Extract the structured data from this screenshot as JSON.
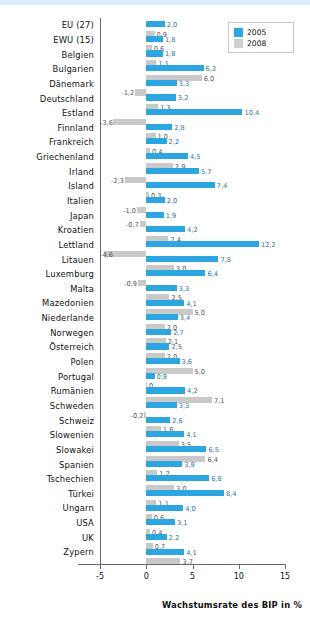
{
  "chart_data": {
    "type": "bar",
    "title": "",
    "xlabel": "Wachstumsrate des BIP in %",
    "ylabel": "",
    "xlim": [
      -5,
      15
    ],
    "xticks": [
      "-5",
      "0",
      "5",
      "10",
      "15"
    ],
    "grid": false,
    "legend_position": "top-right",
    "orientation": "horizontal",
    "categories": [
      "EU (27)",
      "EWU (15)",
      "Belgien",
      "Bulgarien",
      "Dänemark",
      "Deutschland",
      "Estland",
      "Finnland",
      "Frankreich",
      "Griechenland",
      "Irland",
      "Island",
      "Italien",
      "Japan",
      "Kroatien",
      "Lettland",
      "Litauen",
      "Luxemburg",
      "Malta",
      "Mazedonien",
      "Niederlande",
      "Norwegen",
      "Österreich",
      "Polen",
      "Portugal",
      "Rumänien",
      "Schweden",
      "Schweiz",
      "Slowenien",
      "Slowakei",
      "Spanien",
      "Tschechien",
      "Türkei",
      "Ungarn",
      "USA",
      "UK",
      "Zypern"
    ],
    "series": [
      {
        "name": "2005",
        "color": "#2ca6e0",
        "values": [
          2.0,
          1.8,
          1.8,
          6.2,
          3.3,
          3.2,
          10.4,
          2.8,
          2.2,
          4.5,
          5.7,
          7.4,
          2.0,
          1.9,
          4.2,
          12.2,
          7.8,
          6.4,
          3.3,
          4.1,
          3.4,
          2.7,
          2.5,
          3.6,
          0.9,
          4.2,
          3.3,
          2.6,
          4.1,
          6.5,
          3.9,
          6.8,
          8.4,
          4.0,
          3.1,
          2.2,
          4.1
        ],
        "labels": [
          "2,0",
          "1,8",
          "1,8",
          "6,2",
          "3,3",
          "3,2",
          "10,4",
          "2,8",
          "2,2",
          "4,5",
          "5,7",
          "7,4",
          "2,0",
          "1,9",
          "4,2",
          "12,2",
          "7,8",
          "6,4",
          "3,3",
          "4,1",
          "3,4",
          "2,7",
          "2,5",
          "3,6",
          "0,9",
          "4,2",
          "3,3",
          "2,6",
          "4,1",
          "6,5",
          "3,9",
          "6,8",
          "8,4",
          "4,0",
          "3,1",
          "2,2",
          "4,1"
        ]
      },
      {
        "name": "2008",
        "color": "#c9c9c9",
        "values": [
          0.9,
          0.6,
          1.1,
          6.0,
          -1.2,
          1.3,
          -3.6,
          1.0,
          0.4,
          2.9,
          -2.3,
          0.3,
          -1.0,
          -0.7,
          2.4,
          -4.6,
          3.0,
          -0.9,
          2.5,
          5.0,
          2.0,
          2.1,
          2.0,
          5.0,
          0.0,
          7.1,
          -0.2,
          1.6,
          3.5,
          6.4,
          1.2,
          3.0,
          1.1,
          0.6,
          0.4,
          0.7,
          3.7
        ],
        "labels": [
          "0,9",
          "0,6",
          "1,1",
          "6,0",
          "-1,2",
          "1,3",
          "-3,6",
          "1,0",
          "0,4",
          "2,9",
          "-2,3",
          "0,3",
          "-1,0",
          "-0,7",
          "2,4",
          "-4,6",
          "3,0",
          "-0,9",
          "2,5",
          "5,0",
          "2,0",
          "2,1",
          "2,0",
          "5,0",
          "0",
          "7,1",
          "-0,2",
          "1,6",
          "3,5",
          "6,4",
          "1,2",
          "3,0",
          "1,1",
          "0,6",
          "0,4",
          "0,7",
          "3,7"
        ]
      }
    ]
  },
  "legend": {
    "items": [
      {
        "label": "2005",
        "color": "#2ca6e0"
      },
      {
        "label": "2008",
        "color": "#cfcfcf"
      }
    ]
  }
}
